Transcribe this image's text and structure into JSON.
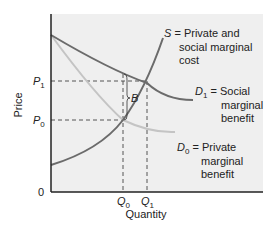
{
  "diagram": {
    "type": "economics-externality",
    "axes": {
      "y_label": "Price",
      "x_label": "Quantity",
      "origin_label": "0"
    },
    "price_ticks": [
      {
        "sym": "P",
        "sub": "1"
      },
      {
        "sym": "P",
        "sub": "0"
      }
    ],
    "quantity_ticks": [
      {
        "sym": "Q",
        "sub": "0"
      },
      {
        "sym": "Q",
        "sub": "1"
      }
    ],
    "curves": {
      "S": {
        "sym": "S",
        "eq": " = ",
        "lines": [
          "Private and",
          "social marginal",
          "cost"
        ]
      },
      "D1": {
        "sym": "D",
        "sub": "1",
        "eq": " = ",
        "lines": [
          "Social",
          "marginal",
          "benefit"
        ]
      },
      "D0": {
        "sym": "D",
        "sub": "0",
        "eq": " = ",
        "lines": [
          "Private",
          "marginal",
          "benefit"
        ]
      }
    },
    "gap_label": "B",
    "colors": {
      "panel": "#efefef",
      "S_curve": "#6b6b6b",
      "D1_curve": "#6b6b6b",
      "D0_curve": "#c4c4c4",
      "axis": "#222222",
      "dash": "#444444"
    }
  }
}
